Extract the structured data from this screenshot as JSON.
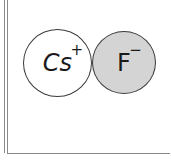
{
  "diagram": {
    "ions": [
      {
        "symbol": "Cs",
        "charge": "+",
        "fill": "#ffffff",
        "stroke": "#3a3a3a"
      },
      {
        "symbol": "F",
        "charge": "−",
        "fill": "#d4d4d4",
        "stroke": "#3a3a3a"
      }
    ]
  }
}
